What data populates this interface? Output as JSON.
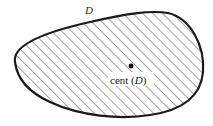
{
  "diagram": {
    "region_label": "D",
    "centroid_label_prefix": "cent (",
    "centroid_label_var": "D",
    "centroid_label_suffix": ")",
    "colors": {
      "stroke": "#1a1a1a",
      "hatch": "#333333",
      "background": "#ffffff"
    }
  }
}
